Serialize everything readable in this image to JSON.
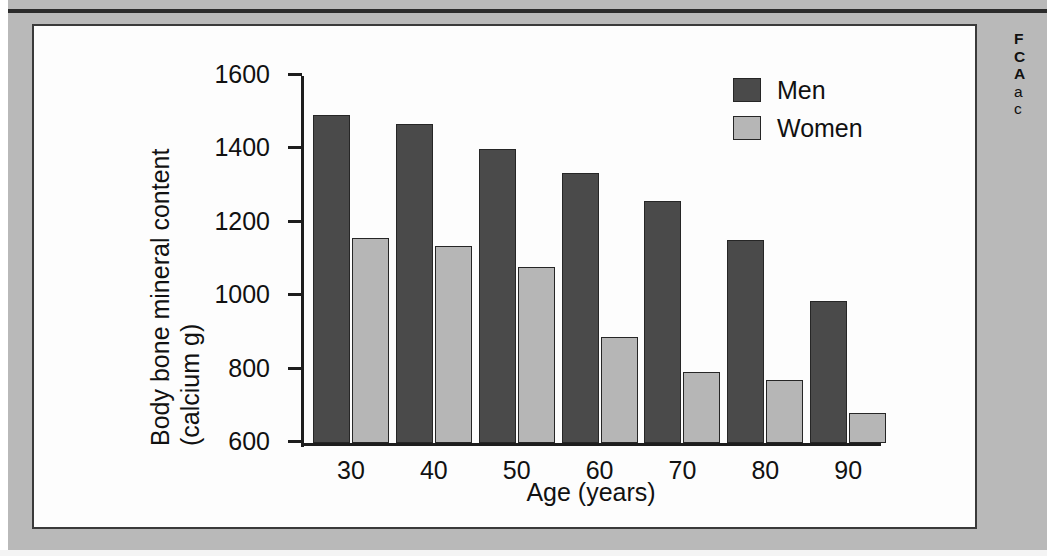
{
  "page": {
    "background_color": "#b9b9b9",
    "panel_background_color": "#fdfdfd",
    "panel_border_color": "#3a3a3a"
  },
  "caption": {
    "line1": "F",
    "line2": "C",
    "line3": "A",
    "line4": "a",
    "line5": "c"
  },
  "chart_data": {
    "type": "bar",
    "title": "",
    "subtitle": "",
    "xlabel": "Age (years)",
    "ylabel": "Body bone mineral content (calcium g)",
    "ylabel_line1": "Body bone mineral content",
    "ylabel_line2": "(calcium g)",
    "categories": [
      "30",
      "40",
      "50",
      "60",
      "70",
      "80",
      "90"
    ],
    "ylim": [
      600,
      1600
    ],
    "yticks": [
      600,
      800,
      1000,
      1200,
      1400,
      1600
    ],
    "ytick_labels": [
      "600",
      "800",
      "1000",
      "1200",
      "1400",
      "1600"
    ],
    "grid": false,
    "legend_position": "top-right",
    "series": [
      {
        "name": "Men",
        "color": "#4a4a4a",
        "values": [
          1495,
          1470,
          1400,
          1335,
          1260,
          1152,
          988
        ]
      },
      {
        "name": "Women",
        "color": "#b6b6b6",
        "values": [
          1158,
          1138,
          1080,
          890,
          793,
          772,
          683
        ]
      }
    ]
  }
}
